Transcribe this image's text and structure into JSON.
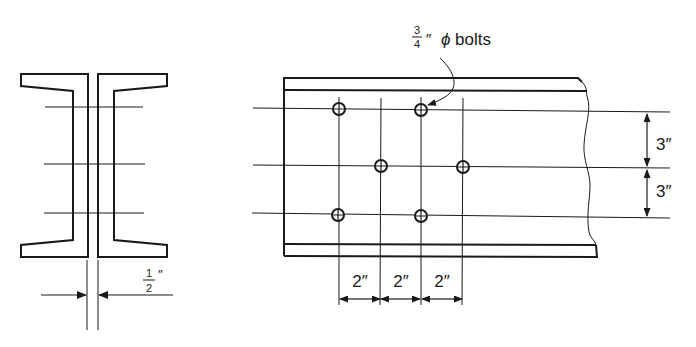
{
  "diagram": {
    "type": "bolted-splice-connection",
    "colors": {
      "ink": "#1a1a1a",
      "background": "#ffffff"
    },
    "section_view": {
      "gap_label": {
        "numerator": "1",
        "denominator": "2",
        "unit": "″"
      },
      "bolt_line_count": 3
    },
    "plan_view": {
      "bolt_callout": {
        "numerator": "3",
        "denominator": "4",
        "unit": "″",
        "symbol": "ϕ",
        "text": "bolts"
      },
      "bolt_columns_x": [
        339,
        380,
        421,
        462
      ],
      "bolt_rows_y": [
        109,
        166,
        214
      ],
      "bolts": [
        {
          "col": 0,
          "row": 0
        },
        {
          "col": 2,
          "row": 0
        },
        {
          "col": 1,
          "row": 1
        },
        {
          "col": 3,
          "row": 1
        },
        {
          "col": 0,
          "row": 2
        },
        {
          "col": 2,
          "row": 2
        }
      ],
      "vertical_dims": [
        "3″",
        "3″"
      ],
      "horizontal_dims": [
        "2″",
        "2″",
        "2″"
      ]
    }
  }
}
